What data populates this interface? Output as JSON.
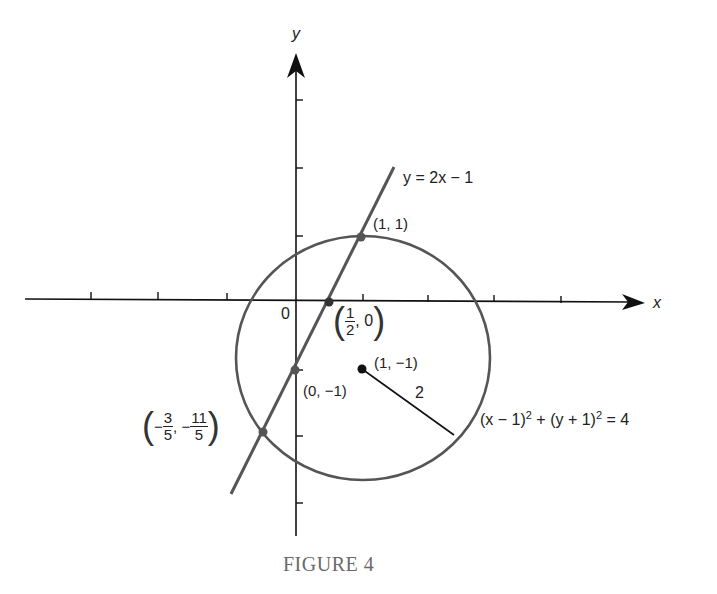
{
  "figure": {
    "caption": "FIGURE 4",
    "axes": {
      "x_label": "x",
      "y_label": "y",
      "origin_label": "0"
    },
    "line": {
      "equation": "y = 2x − 1"
    },
    "circle": {
      "equation_part1": "(x − 1)",
      "sup1": "2",
      "equation_part2": " + (y + 1)",
      "sup2": "2",
      "equation_part3": " = 4",
      "radius_label": "2",
      "center_label": "(1, −1)"
    },
    "points": {
      "p11": "(1, 1)",
      "p_half": {
        "num": "1",
        "den": "2",
        "rest": ", 0"
      },
      "p0m1": "(0, −1)",
      "p_neg": {
        "num1": "3",
        "den1": "5",
        "num2": "11",
        "den2": "5"
      }
    },
    "colors": {
      "curve": "#555555",
      "axis": "#111111",
      "caption": "#6a6a6a"
    }
  }
}
